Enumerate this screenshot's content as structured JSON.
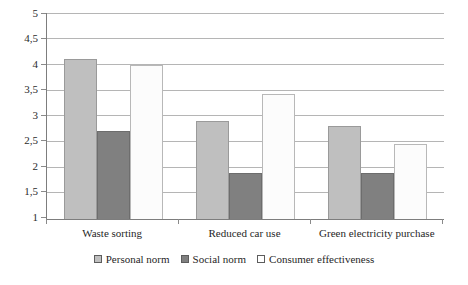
{
  "chart_data": {
    "type": "bar",
    "title": "",
    "subtitle": "",
    "xlabel": "",
    "ylabel": "",
    "categories": [
      "Waste sorting",
      "Reduced car use",
      "Green electricity purchase"
    ],
    "series": [
      {
        "name": "Personal norm",
        "color": "#BFBFBF",
        "values": [
          4.1,
          2.9,
          2.8
        ]
      },
      {
        "name": "Social norm",
        "color": "#808080",
        "values": [
          2.7,
          1.9,
          1.9
        ]
      },
      {
        "name": "Consumer effectiveness",
        "color": "#FFFFFF",
        "values": [
          4.0,
          3.43,
          2.45
        ]
      }
    ],
    "ylim": [
      1,
      5
    ],
    "ytick_labels": [
      "5",
      "4,5",
      "4",
      "3,5",
      "3",
      "2,5",
      "2",
      "1,5",
      "1"
    ],
    "ytick_values": [
      5,
      4.5,
      4,
      3.5,
      3,
      2.5,
      2,
      1.5,
      1
    ],
    "grid": true,
    "legend_position": "bottom",
    "decimal_separator": ","
  }
}
